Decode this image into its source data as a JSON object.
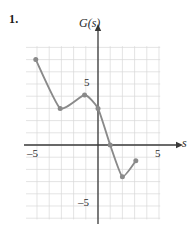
{
  "problem": {
    "number": "1."
  },
  "axes": {
    "y_axis_label": "G(s)",
    "x_axis_label": "s",
    "x_tick_neg": "–5",
    "x_tick_pos": "5",
    "y_tick_pos": "5",
    "y_tick_neg": "–5"
  },
  "colors": {
    "curve": "#8a8a8a",
    "marker": "#8a8a8a",
    "axis": "#3a3a3a",
    "grid": "#d9d9d9",
    "text": "#1a1a1a"
  },
  "chart_data": {
    "type": "line",
    "title": "",
    "xlabel": "s",
    "ylabel": "G(s)",
    "xlim": [
      -6,
      6
    ],
    "ylim": [
      -8,
      6
    ],
    "grid": true,
    "legend": "none",
    "marked_points": [
      {
        "x": -5.1,
        "y": 7.0,
        "role": "left-endpoint"
      },
      {
        "x": -3.1,
        "y": 3.0,
        "role": "local-minimum"
      },
      {
        "x": -1.1,
        "y": 4.1,
        "role": "local-maximum"
      },
      {
        "x": 0.0,
        "y": 3.0,
        "role": "y-intercept"
      },
      {
        "x": 1.0,
        "y": 0.0,
        "role": "x-intercept"
      },
      {
        "x": 2.0,
        "y": -2.6,
        "role": "local-minimum"
      },
      {
        "x": 3.1,
        "y": -1.3,
        "role": "right-endpoint"
      }
    ],
    "x_ticks": [
      -5,
      5
    ],
    "y_ticks": [
      5,
      -5
    ],
    "grid_x_range": [
      -5.9,
      5.1
    ],
    "grid_y_range": [
      -6.1,
      8.1
    ]
  }
}
